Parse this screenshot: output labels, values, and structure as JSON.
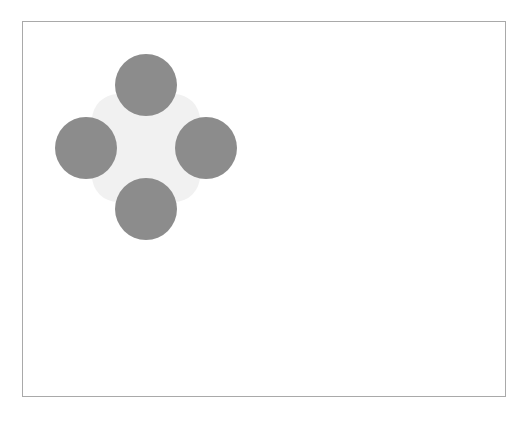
{
  "canvas": {
    "width": 528,
    "height": 421,
    "background_color": "#ffffff"
  },
  "frame": {
    "name": "canvas-border-frame",
    "x": 22,
    "y": 21,
    "width": 484,
    "height": 376,
    "border_color": "#a9a9a9",
    "border_width": 1,
    "fill_color": "#ffffff"
  },
  "figure": {
    "backdrop": {
      "name": "rounded-square-backdrop",
      "shape": "rounded-square",
      "center_x": 123,
      "center_y": 126,
      "width": 108,
      "height": 108,
      "corner_radius": 26,
      "fill_color": "#f1f1f1"
    },
    "circles": [
      {
        "name": "top-circle",
        "position": "top",
        "center_x": 123,
        "center_y": 63,
        "radius": 31,
        "fill_color": "#8c8c8c"
      },
      {
        "name": "left-circle",
        "position": "left",
        "center_x": 63,
        "center_y": 126,
        "radius": 31,
        "fill_color": "#8c8c8c"
      },
      {
        "name": "right-circle",
        "position": "right",
        "center_x": 183,
        "center_y": 126,
        "radius": 31,
        "fill_color": "#8c8c8c"
      },
      {
        "name": "bottom-circle",
        "position": "bottom",
        "center_x": 123,
        "center_y": 187,
        "radius": 31,
        "fill_color": "#8c8c8c"
      }
    ]
  }
}
